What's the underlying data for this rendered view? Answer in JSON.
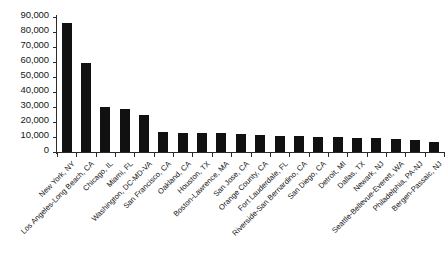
{
  "chart_data": {
    "type": "bar",
    "title": "",
    "subtitle": "",
    "xlabel": "",
    "ylabel": "",
    "ylim": [
      0,
      90000
    ],
    "grid": false,
    "legend": null,
    "bar_color": "#111111",
    "axis_color": "#2b2b2b",
    "y_ticks": [
      0,
      10000,
      20000,
      30000,
      40000,
      50000,
      60000,
      70000,
      80000,
      90000
    ],
    "y_tick_labels": [
      "0",
      "10,000",
      "20,000",
      "30,000",
      "40,000",
      "50,000",
      "60,000",
      "70,000",
      "80,000",
      "90,000"
    ],
    "categories": [
      "New York, NY",
      "Los Angeles-Long Beach, CA",
      "Chicago, IL",
      "Miami, FL",
      "Washington, DC-MD-VA",
      "San Francisco, CA",
      "Oakland, CA",
      "Houston, TX",
      "Boston-Lawrence, MA",
      "San Jose, CA",
      "Orange County, CA",
      "Fort Lauderdale, FL",
      "Riverside-San Bernardino, CA",
      "San Diego, CA",
      "Detroit, MI",
      "Dallas, TX",
      "Newark, NJ",
      "Seattle-Bellevue-Everett, WA",
      "Philadelphia, PA-NJ",
      "Bergen-Passaic, NJ"
    ],
    "values": [
      86000,
      59500,
      30000,
      29000,
      24500,
      13500,
      12800,
      12700,
      12500,
      12300,
      11500,
      10500,
      10400,
      10200,
      9800,
      9500,
      9200,
      8800,
      8200,
      7000
    ]
  }
}
